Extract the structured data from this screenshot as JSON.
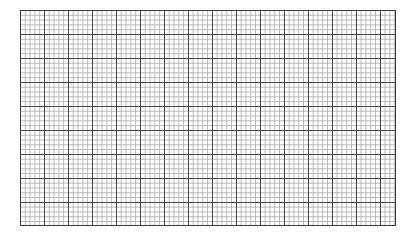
{
  "document": {
    "title": "Graph Paper Grid",
    "type": "grid-paper",
    "background_color": "#ffffff"
  },
  "grid": {
    "name": "graph-paper-grid",
    "origin_x": 20,
    "origin_y": 10,
    "width": 376,
    "height": 216,
    "minor_cell_size": 4.8,
    "major_every_n_cells": 5,
    "major_cell_size": 24,
    "minor_columns": 78,
    "minor_rows": 45,
    "major_columns": 15,
    "major_rows": 9,
    "minor_line_color": "#b8b8b8",
    "major_line_color": "#4a4a4a",
    "border_color": "#3a3a3a",
    "minor_line_width": 1,
    "major_line_width": 1,
    "border_line_width": 1
  }
}
